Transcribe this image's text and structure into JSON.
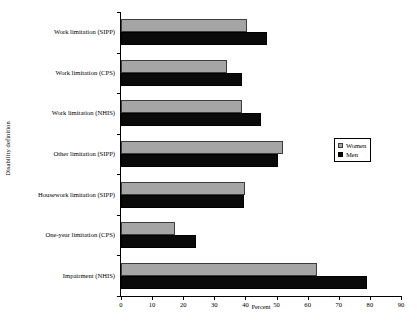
{
  "chart_data": {
    "type": "bar",
    "orientation": "horizontal",
    "title": "",
    "xlabel": "Percent",
    "ylabel": "Disability definition",
    "xlim": [
      0,
      90
    ],
    "xticks": [
      0,
      10,
      20,
      30,
      40,
      50,
      60,
      70,
      80,
      90
    ],
    "grid": false,
    "legend_position": "right",
    "categories": [
      "Work limitation (SIPP)",
      "Work limitation (CPS)",
      "Work limitation (NHIS)",
      "Other limitation (SIPP)",
      "Housework limitation (SIPP)",
      "One-year limitation (CPS)",
      "Impairment (NHIS)"
    ],
    "series": [
      {
        "name": "Women",
        "color": "#a5a5a5",
        "values": [
          40.5,
          34,
          39,
          52,
          40,
          17.5,
          63
        ]
      },
      {
        "name": "Men",
        "color": "#0a0a0a",
        "values": [
          47,
          39,
          45,
          50.5,
          39.5,
          24,
          79
        ]
      }
    ]
  }
}
